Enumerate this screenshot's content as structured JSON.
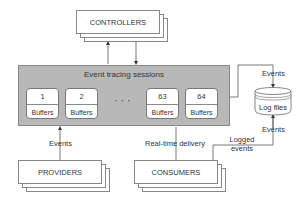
{
  "diagram": {
    "controllers": {
      "label": "CONTROLLERS"
    },
    "session": {
      "title": "Event tracing sessions",
      "ellipsis": "· · ·",
      "buffers": [
        {
          "number": "1",
          "label": "Buffers"
        },
        {
          "number": "2",
          "label": "Buffers"
        },
        {
          "number": "63",
          "label": "Buffers"
        },
        {
          "number": "64",
          "label": "Buffers"
        }
      ]
    },
    "log_files": {
      "label": "Log files"
    },
    "providers": {
      "label": "PROVIDERS"
    },
    "consumers": {
      "label": "CONSUMERS"
    },
    "edges": {
      "session_to_logfiles": "Events",
      "providers_to_session": "Events",
      "session_to_consumers": "Real-time delivery",
      "logfiles_out": "Events",
      "logged_events_line1": "Logged",
      "logged_events_line2": "events"
    },
    "colors": {
      "session_fill": "#b8b8b8",
      "border": "#888888",
      "text": "#333333"
    }
  }
}
